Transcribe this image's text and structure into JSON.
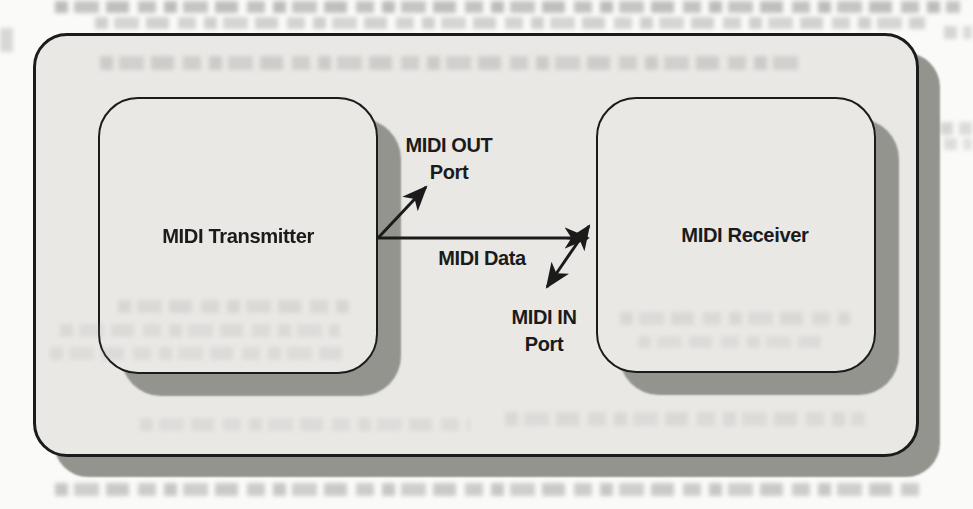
{
  "diagram": {
    "transmitter": {
      "label": "MIDI Transmitter"
    },
    "receiver": {
      "label": "MIDI Receiver"
    },
    "midi_out_port": {
      "line1": "MIDI OUT",
      "line2": "Port"
    },
    "midi_data": {
      "label": "MIDI Data"
    },
    "midi_in_port": {
      "line1": "MIDI IN",
      "line2": "Port"
    },
    "connections": [
      {
        "from": "MIDI Transmitter",
        "to": "MIDI OUT Port",
        "direction": "one-way"
      },
      {
        "from": "MIDI Transmitter",
        "to": "MIDI Receiver",
        "label": "MIDI Data",
        "direction": "one-way"
      },
      {
        "from": "MIDI Receiver",
        "to": "MIDI IN Port",
        "direction": "two-way"
      }
    ]
  },
  "colors": {
    "page_background": "#fafaf8",
    "box_fill": "#e9e8e5",
    "box_border": "#1b1b1b",
    "shadow": "#94948f",
    "text": "#1b1b1b"
  }
}
